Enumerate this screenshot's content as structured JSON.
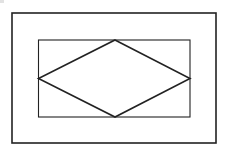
{
  "canvas": {
    "width": 225,
    "height": 153,
    "background": "#ffffff"
  },
  "diagram": {
    "stroke_color": "#222222",
    "outer_rectangle": {
      "x": 12,
      "y": 13,
      "width": 204,
      "height": 130,
      "stroke_width": 1.6
    },
    "inner_rectangle": {
      "x": 38.5,
      "y": 40,
      "width": 151.5,
      "height": 77,
      "stroke_width": 1.1
    },
    "rhombus": {
      "stroke_width": 1.6,
      "vertices": {
        "top": [
          115,
          40
        ],
        "right": [
          190,
          78.5
        ],
        "bottom": [
          115,
          117
        ],
        "left": [
          38.5,
          78.5
        ]
      }
    }
  }
}
